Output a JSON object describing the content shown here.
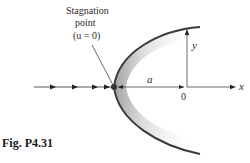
{
  "figure": {
    "caption": "Fig. P4.31",
    "stagnation_label": {
      "line1": "Stagnation",
      "line2": "point",
      "line3": "(u = 0)"
    },
    "labels": {
      "a": "a",
      "origin": "0",
      "x_axis": "x",
      "y_axis": "y"
    },
    "colors": {
      "curve": "#3a3a3a",
      "line": "#444444",
      "shade": "#9a9a9a"
    }
  }
}
